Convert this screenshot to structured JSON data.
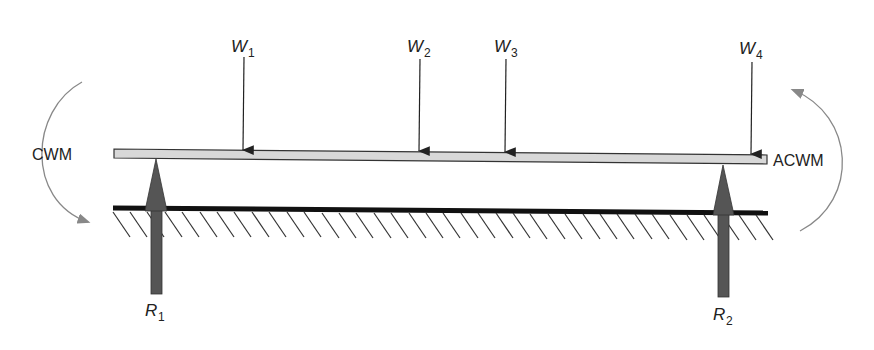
{
  "diagram": {
    "colors": {
      "beam_fill": "#d8d8d8",
      "beam_stroke": "#333333",
      "reaction_fill": "#555555",
      "ground": "#111111",
      "moment_arc": "#888888",
      "text": "#222222"
    },
    "loads": [
      {
        "symbol": "W",
        "sub": "1",
        "x": 243
      },
      {
        "symbol": "W",
        "sub": "2",
        "x": 419
      },
      {
        "symbol": "W",
        "sub": "3",
        "x": 505
      },
      {
        "symbol": "W",
        "sub": "4",
        "x": 751
      }
    ],
    "reactions": [
      {
        "symbol": "R",
        "sub": "1",
        "x": 156
      },
      {
        "symbol": "R",
        "sub": "2",
        "x": 723
      }
    ],
    "moments": {
      "left_label": "CWM",
      "right_label": "ACWM"
    }
  }
}
